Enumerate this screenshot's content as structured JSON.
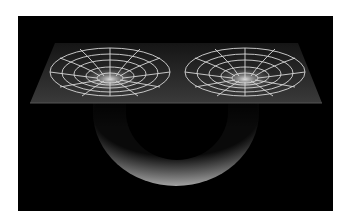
{
  "figure": {
    "colors": {
      "page_background": "#ffffff",
      "frame_background": "#000000",
      "grid_lines": "#d8d8d8",
      "sheet": "#2a2a2a",
      "tube": "#9a9a9a"
    },
    "elements": {
      "sheet": "spacetime-sheet",
      "left_funnel": "left-mouth",
      "right_funnel": "right-mouth",
      "tube": "wormhole-throat"
    }
  }
}
